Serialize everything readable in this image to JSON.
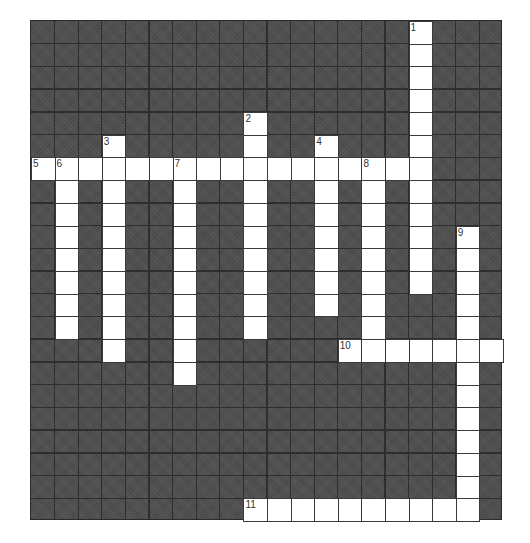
{
  "puzzle": {
    "title": "",
    "cols": 20,
    "rows": 22,
    "colors": {
      "block": "#4f4f4f",
      "gridline": "#2e2e2e",
      "cell": "#ffffff",
      "number": "#333333"
    },
    "entries": [
      {
        "number": "1",
        "direction": "down",
        "row": 0,
        "col": 16,
        "length": 12
      },
      {
        "number": "2",
        "direction": "down",
        "row": 4,
        "col": 9,
        "length": 10
      },
      {
        "number": "3",
        "direction": "down",
        "row": 5,
        "col": 3,
        "length": 10
      },
      {
        "number": "4",
        "direction": "down",
        "row": 5,
        "col": 12,
        "length": 8
      },
      {
        "number": "5",
        "direction": "across",
        "row": 6,
        "col": 0,
        "length": 17
      },
      {
        "number": "6",
        "direction": "down",
        "row": 6,
        "col": 1,
        "length": 8
      },
      {
        "number": "7",
        "direction": "down",
        "row": 6,
        "col": 6,
        "length": 10
      },
      {
        "number": "8",
        "direction": "down",
        "row": 6,
        "col": 14,
        "length": 8
      },
      {
        "number": "9",
        "direction": "down",
        "row": 9,
        "col": 18,
        "length": 13
      },
      {
        "number": "10",
        "direction": "across",
        "row": 14,
        "col": 13,
        "length": 7
      },
      {
        "number": "11",
        "direction": "across",
        "row": 21,
        "col": 9,
        "length": 10
      }
    ]
  }
}
